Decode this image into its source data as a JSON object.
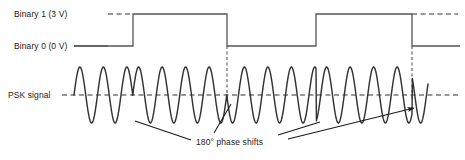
{
  "figure": {
    "type": "psk-modulation-diagram",
    "title_visible": false,
    "background_color": "#ffffff",
    "line_color": "#333333",
    "text_color": "#1a1a1a"
  },
  "labels": {
    "binary_one": "Binary 1 (3 V)",
    "binary_zero": "Binary 0 (0 V)",
    "psk_signal": "PSK signal",
    "phase_shift_annotation": "180° phase shifts"
  },
  "chart_data": {
    "type": "line",
    "title": "",
    "xlabel": "",
    "ylabel": "",
    "series": [
      {
        "name": "Binary 1 (3 V)",
        "role": "reference-level-dashed",
        "style": "dashed",
        "level_label": "Binary 1 (3 V)",
        "voltage": 3,
        "y_px": 14
      },
      {
        "name": "Binary 0 (0 V)",
        "role": "reference-level-solid",
        "style": "solid",
        "level_label": "Binary 0 (0 V)",
        "voltage": 0,
        "y_px": 46
      },
      {
        "name": "Digital data signal",
        "role": "digital-waveform",
        "style": "solid",
        "bits": [
          0,
          1,
          0,
          1,
          0
        ],
        "transitions_px": [
          133,
          227,
          316,
          412
        ],
        "transition_types": [
          "rise",
          "fall",
          "rise",
          "fall"
        ],
        "segments": [
          {
            "bit": 0,
            "level": "Binary 0 (0 V)",
            "x_start": 74,
            "x_end": 133
          },
          {
            "bit": 1,
            "level": "Binary 1 (3 V)",
            "x_start": 133,
            "x_end": 227
          },
          {
            "bit": 0,
            "level": "Binary 0 (0 V)",
            "x_start": 227,
            "x_end": 316
          },
          {
            "bit": 1,
            "level": "Binary 1 (3 V)",
            "x_start": 316,
            "x_end": 412
          },
          {
            "bit": 0,
            "level": "Binary 0 (0 V)",
            "x_start": 412,
            "x_end": 460
          }
        ]
      },
      {
        "name": "PSK signal",
        "role": "modulated-carrier",
        "style": "solid-sine",
        "baseline_y_px": 95,
        "amplitude_px": 28,
        "period_px": 23.5,
        "x_start": 74,
        "x_end": 428,
        "phase_shift_count": 4,
        "phase_shift_degrees": 180,
        "phase_shift_x_px": [
          133,
          227,
          316,
          412
        ]
      }
    ],
    "annotations": [
      {
        "text": "180° phase shifts",
        "x_px": 196,
        "y_px": 137,
        "arrow_targets_px": [
          {
            "x": 133,
            "y": 121
          },
          {
            "x": 227,
            "y": 104
          },
          {
            "x": 316,
            "y": 122
          },
          {
            "x": 412,
            "y": 108
          }
        ],
        "arrow_count": 4
      }
    ],
    "guides": [
      {
        "type": "vertical-dashed",
        "x_px": 227,
        "y_top": 46,
        "y_bottom": 100
      },
      {
        "type": "vertical-dashed",
        "x_px": 412,
        "y_top": 46,
        "y_bottom": 100
      }
    ],
    "grid": false,
    "legend": "none"
  }
}
